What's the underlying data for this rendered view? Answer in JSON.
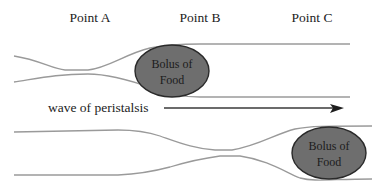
{
  "diagram": {
    "point_labels": [
      {
        "label": "Point A",
        "x": 90
      },
      {
        "label": "Point B",
        "x": 200
      },
      {
        "label": "Point C",
        "x": 315
      }
    ],
    "top_bolus": {
      "line1": "Bolus of",
      "line2": "Food"
    },
    "bottom_bolus": {
      "line1": "Bolus of",
      "line2": "Food"
    },
    "wave_label": "wave of peristalsis",
    "colors": {
      "wall": "#9a9a9a",
      "bolus_fill": "#6e6e6e",
      "bolus_stroke": "#2a2a2a",
      "arrow": "#1e1e1e",
      "text": "#222222"
    }
  }
}
